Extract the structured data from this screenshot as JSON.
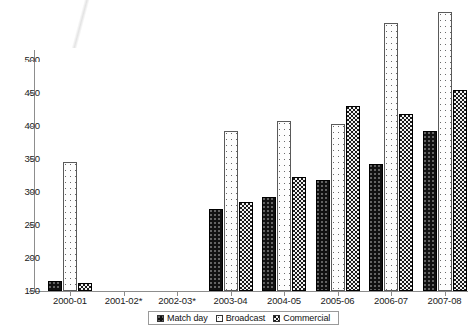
{
  "chart_data": {
    "type": "bar",
    "title": "",
    "subtitle": "",
    "xlabel": "",
    "ylabel": "",
    "ylim": [
      150,
      500
    ],
    "ytick_values": [
      150,
      200,
      250,
      300,
      350,
      400,
      450,
      500
    ],
    "ytick_labels": [
      "150",
      "200",
      "250",
      "300",
      "350",
      "400",
      "450",
      "500"
    ],
    "top_label_clipped": true,
    "grid": false,
    "legend_position": "bottom-center",
    "categories": [
      "2000-01",
      "2001-02*",
      "2002-03*",
      "2003-04",
      "2004-05",
      "2005-06",
      "2006-07",
      "2007-08"
    ],
    "series": [
      {
        "name": "Match day",
        "pattern": "solid-black-dotted",
        "values": [
          165,
          null,
          null,
          275,
          292,
          318,
          342,
          393
        ]
      },
      {
        "name": "Broadcast",
        "pattern": "white-dotted",
        "values": [
          345,
          null,
          null,
          392,
          408,
          403,
          556,
          572
        ]
      },
      {
        "name": "Commercial",
        "pattern": "dark-checker",
        "values": [
          162,
          null,
          null,
          285,
          323,
          430,
          418,
          455
        ]
      }
    ]
  },
  "legend": {
    "items": [
      {
        "label": "Match day"
      },
      {
        "label": "Broadcast"
      },
      {
        "label": "Commercial"
      }
    ]
  },
  "colors": {
    "axis": "#8d8d8d",
    "text": "#1a1a1a",
    "matchday": "#111111",
    "broadcast": "#fdfdfd",
    "commercial": "#1b1b1b",
    "background": "#ffffff"
  }
}
